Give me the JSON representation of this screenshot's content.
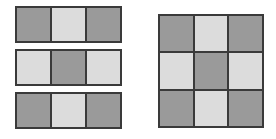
{
  "figure": {
    "background_color": "#ffffff",
    "border_color": "#3a3a3a",
    "palette": {
      "dark": "#9a9a9a",
      "light": "#dcdcdc"
    }
  },
  "left_group": {
    "name": "three-separate-rows",
    "description": "Three detached 1-by-3 horizontal strips stacked vertically",
    "rows": [
      {
        "name": "strip-1",
        "cells": [
          {
            "name": "cell-r1c1",
            "shade": "dark",
            "color": "#9a9a9a"
          },
          {
            "name": "cell-r1c2",
            "shade": "light",
            "color": "#dcdcdc"
          },
          {
            "name": "cell-r1c3",
            "shade": "dark",
            "color": "#9a9a9a"
          }
        ]
      },
      {
        "name": "strip-2",
        "cells": [
          {
            "name": "cell-r2c1",
            "shade": "light",
            "color": "#dcdcdc"
          },
          {
            "name": "cell-r2c2",
            "shade": "dark",
            "color": "#9a9a9a"
          },
          {
            "name": "cell-r2c3",
            "shade": "light",
            "color": "#dcdcdc"
          }
        ]
      },
      {
        "name": "strip-3",
        "cells": [
          {
            "name": "cell-r3c1",
            "shade": "dark",
            "color": "#9a9a9a"
          },
          {
            "name": "cell-r3c2",
            "shade": "light",
            "color": "#dcdcdc"
          },
          {
            "name": "cell-r3c3",
            "shade": "dark",
            "color": "#9a9a9a"
          }
        ]
      }
    ]
  },
  "right_group": {
    "name": "combined-3x3-grid",
    "description": "One contiguous 3-by-3 checkerboard grid",
    "cells": [
      {
        "name": "cell-r1c1",
        "shade": "dark",
        "color": "#9a9a9a"
      },
      {
        "name": "cell-r1c2",
        "shade": "light",
        "color": "#dcdcdc"
      },
      {
        "name": "cell-r1c3",
        "shade": "dark",
        "color": "#9a9a9a"
      },
      {
        "name": "cell-r2c1",
        "shade": "light",
        "color": "#dcdcdc"
      },
      {
        "name": "cell-r2c2",
        "shade": "dark",
        "color": "#9a9a9a"
      },
      {
        "name": "cell-r2c3",
        "shade": "light",
        "color": "#dcdcdc"
      },
      {
        "name": "cell-r3c1",
        "shade": "dark",
        "color": "#9a9a9a"
      },
      {
        "name": "cell-r3c2",
        "shade": "light",
        "color": "#dcdcdc"
      },
      {
        "name": "cell-r3c3",
        "shade": "dark",
        "color": "#9a9a9a"
      }
    ]
  }
}
